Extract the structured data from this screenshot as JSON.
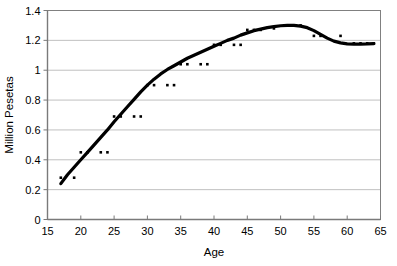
{
  "chart_data": {
    "type": "scatter",
    "title": "",
    "subtitle": "",
    "xlabel": "Age",
    "ylabel": "Million Pesetas",
    "xlim": [
      15,
      65
    ],
    "ylim": [
      0,
      1.4
    ],
    "xticks": [
      15,
      20,
      25,
      30,
      35,
      40,
      45,
      50,
      55,
      60,
      65
    ],
    "yticks": [
      0,
      0.2,
      0.4,
      0.6,
      0.8,
      1,
      1.2,
      1.4
    ],
    "xtick_labels": [
      "15",
      "20",
      "25",
      "30",
      "35",
      "40",
      "45",
      "50",
      "55",
      "60",
      "65"
    ],
    "ytick_labels": [
      "0",
      "0.2",
      "0.4",
      "0.6",
      "0.8",
      "1",
      "1.2",
      "1.4"
    ],
    "grid": {
      "horizontal": true,
      "vertical": false
    },
    "legend": {
      "visible": false,
      "position": "none"
    },
    "marker_color": "#000000",
    "line_color": "#000000",
    "axis_color": "#808080",
    "grid_color": "#c0c0c0",
    "series": [
      {
        "name": "observations",
        "kind": "scatter",
        "x": [
          17,
          19,
          20,
          21,
          23,
          24,
          25,
          26,
          28,
          29,
          30,
          31,
          33,
          34,
          35,
          36,
          38,
          39,
          40,
          41,
          43,
          44,
          45,
          46,
          47,
          49,
          51,
          52,
          53,
          55,
          56,
          59,
          61,
          62,
          63,
          64
        ],
        "y": [
          0.28,
          0.28,
          0.45,
          0.45,
          0.45,
          0.45,
          0.69,
          0.69,
          0.69,
          0.69,
          0.9,
          0.9,
          0.9,
          0.9,
          1.04,
          1.04,
          1.04,
          1.04,
          1.17,
          1.17,
          1.17,
          1.17,
          1.27,
          1.27,
          1.27,
          1.28,
          1.3,
          1.3,
          1.3,
          1.23,
          1.23,
          1.23,
          1.18,
          1.18,
          1.18,
          1.18
        ]
      },
      {
        "name": "smoothed-fit",
        "kind": "line",
        "x": [
          17,
          18,
          19,
          20,
          21,
          22,
          23,
          24,
          25,
          26,
          27,
          28,
          29,
          30,
          31,
          32,
          33,
          34,
          35,
          36,
          37,
          38,
          39,
          40,
          41,
          42,
          43,
          44,
          45,
          46,
          47,
          48,
          49,
          50,
          51,
          52,
          53,
          54,
          55,
          56,
          57,
          58,
          59,
          60,
          61,
          62,
          63,
          64
        ],
        "y": [
          0.24,
          0.3,
          0.35,
          0.4,
          0.45,
          0.5,
          0.55,
          0.6,
          0.655,
          0.705,
          0.755,
          0.805,
          0.855,
          0.9,
          0.94,
          0.975,
          1.005,
          1.03,
          1.055,
          1.08,
          1.1,
          1.12,
          1.14,
          1.16,
          1.18,
          1.2,
          1.215,
          1.235,
          1.25,
          1.265,
          1.275,
          1.285,
          1.292,
          1.298,
          1.3,
          1.3,
          1.295,
          1.285,
          1.265,
          1.24,
          1.215,
          1.195,
          1.183,
          1.177,
          1.175,
          1.175,
          1.176,
          1.178
        ]
      }
    ]
  }
}
